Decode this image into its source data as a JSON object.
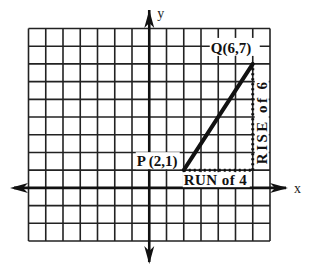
{
  "diagram": {
    "type": "coordinate-grid-slope",
    "grid": {
      "x_min": -7,
      "x_max": 7,
      "y_min": -3,
      "y_max": 9,
      "line_color": "#222222"
    },
    "axes": {
      "x_label": "x",
      "y_label": "y",
      "color": "#111111"
    },
    "points": [
      {
        "name": "P",
        "x": 2,
        "y": 1,
        "label": "P (2,1)"
      },
      {
        "name": "Q",
        "x": 6,
        "y": 7,
        "label": "Q(6,7)"
      }
    ],
    "segment": {
      "from": "P",
      "to": "Q",
      "color": "#111111"
    },
    "run": {
      "label": "RUN of 4",
      "value": 4
    },
    "rise": {
      "label": "RISE of 6",
      "value": 6
    }
  }
}
